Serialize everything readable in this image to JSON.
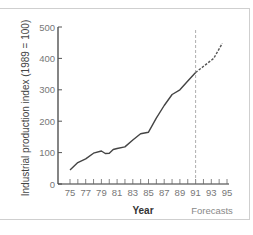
{
  "chart_data": {
    "type": "line",
    "title": "",
    "xlabel": "Year",
    "ylabel": "Industrial production index (1989 = 100)",
    "x_ticks": [
      75,
      76,
      77,
      78,
      79,
      80,
      81,
      82,
      83,
      84,
      85,
      86,
      87,
      88,
      89,
      90,
      91,
      92,
      93,
      94,
      95
    ],
    "x_tick_labels": [
      "75",
      "77",
      "79",
      "81",
      "83",
      "85",
      "87",
      "89",
      "91",
      "93",
      "95"
    ],
    "y_ticks": [
      0,
      100,
      200,
      300,
      400,
      500
    ],
    "y_tick_labels": [
      "0",
      "100",
      "200",
      "300",
      "400",
      "500"
    ],
    "xlim": [
      74,
      95
    ],
    "ylim": [
      0,
      500
    ],
    "grid": false,
    "series": [
      {
        "name": "Actual",
        "style": "solid",
        "x": [
          75,
          76,
          77,
          78,
          79,
          79.5,
          80,
          80.5,
          81,
          82,
          83,
          84,
          85,
          86,
          87,
          88,
          89,
          90,
          91
        ],
        "values": [
          45,
          68,
          80,
          98,
          105,
          97,
          98,
          110,
          113,
          118,
          140,
          160,
          165,
          210,
          250,
          285,
          300,
          328,
          355
        ]
      },
      {
        "name": "Forecast",
        "style": "dashed",
        "x": [
          91,
          93.3,
          94.4
        ],
        "values": [
          355,
          400,
          448
        ]
      }
    ],
    "annotations": [
      {
        "type": "vertical-dashed-line",
        "x": 91,
        "label": "Forecasts"
      }
    ]
  },
  "labels": {
    "ylabel": "Industrial production index (1989 = 100)",
    "xlabel": "Year",
    "forecast": "Forecasts"
  }
}
